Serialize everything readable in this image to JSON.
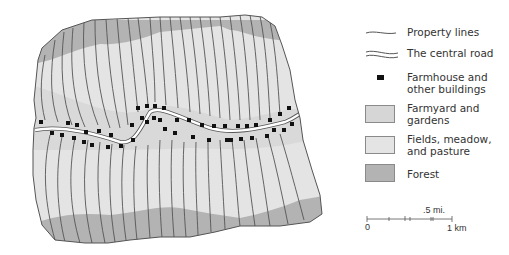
{
  "map": {
    "title": "",
    "colors": {
      "farmyard": "#d6d6d6",
      "fields": "#e4e4e4",
      "forest": "#b3b3b3",
      "property_line": "#555555",
      "road_fill": "#ffffff",
      "building": "#111111"
    }
  },
  "legend": {
    "items": [
      {
        "symbol": "property-line",
        "label": "Property lines"
      },
      {
        "symbol": "road",
        "label": "The central road"
      },
      {
        "symbol": "building",
        "label": "Farmhouse and\nother buildings"
      },
      {
        "symbol": "farmyard-swatch",
        "label": "Farmyard and\ngardens"
      },
      {
        "symbol": "fields-swatch",
        "label": "Fields, meadow,\nand pasture"
      },
      {
        "symbol": "forest-swatch",
        "label": "Forest"
      }
    ]
  },
  "scale": {
    "mi_label": ".5 mi.",
    "zero_label": "0",
    "km_label": "1 km"
  }
}
